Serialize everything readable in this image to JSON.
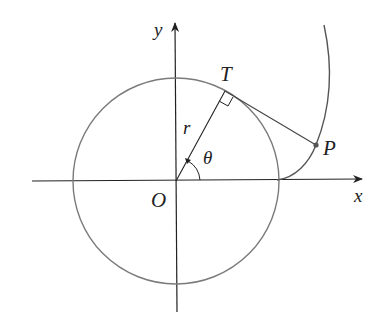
{
  "diagram": {
    "type": "involute of a circle",
    "labels": {
      "y_axis": "y",
      "x_axis": "x",
      "origin": "O",
      "tangent_point": "T",
      "radius": "r",
      "angle": "θ",
      "point": "P"
    },
    "colors": {
      "circle": "#7a7a7a",
      "axes": "#222222",
      "curve": "#555555",
      "text": "#222222"
    }
  }
}
